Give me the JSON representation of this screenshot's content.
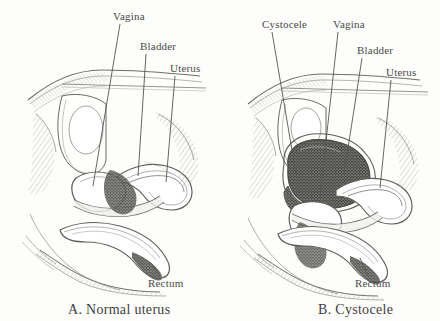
{
  "figure": {
    "background_color": "#fdfdfb",
    "ink_color": "#4a4a48",
    "shade_color": "#6b6b68",
    "dark_fill_color": "#3a3a38"
  },
  "panels": [
    {
      "id": "panel-a",
      "caption": "A.  Normal uterus",
      "labels": [
        {
          "text": "Vagina",
          "x": 113,
          "y": 10,
          "leader": {
            "x1": 120,
            "y1": 24,
            "x2": 93,
            "y2": 186
          }
        },
        {
          "text": "Bladder",
          "x": 140,
          "y": 40,
          "leader": {
            "x1": 146,
            "y1": 54,
            "x2": 138,
            "y2": 176
          }
        },
        {
          "text": "Uterus",
          "x": 170,
          "y": 62,
          "leader": {
            "x1": 175,
            "y1": 76,
            "x2": 166,
            "y2": 182
          }
        },
        {
          "text": "Rectum",
          "x": 148,
          "y": 277,
          "leader": {
            "x1": 160,
            "y1": 276,
            "x2": 150,
            "y2": 262
          }
        }
      ]
    },
    {
      "id": "panel-b",
      "caption": "B. Cystocele",
      "labels": [
        {
          "text": "Cystocele",
          "x": 262,
          "y": 18,
          "leader": {
            "x1": 272,
            "y1": 32,
            "x2": 296,
            "y2": 174
          }
        },
        {
          "text": "Vagina",
          "x": 333,
          "y": 18,
          "leader": {
            "x1": 338,
            "y1": 32,
            "x2": 320,
            "y2": 196
          }
        },
        {
          "text": "Bladder",
          "x": 357,
          "y": 44,
          "leader": {
            "x1": 362,
            "y1": 58,
            "x2": 344,
            "y2": 174
          }
        },
        {
          "text": "Uterus",
          "x": 386,
          "y": 66,
          "leader": {
            "x1": 391,
            "y1": 80,
            "x2": 380,
            "y2": 188
          }
        },
        {
          "text": "Rectum",
          "x": 355,
          "y": 277,
          "leader": {
            "x1": 368,
            "y1": 276,
            "x2": 360,
            "y2": 258
          }
        }
      ]
    }
  ]
}
